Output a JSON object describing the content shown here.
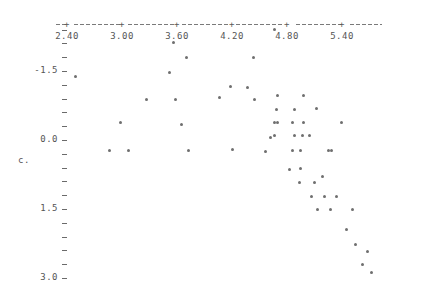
{
  "chart_data": {
    "type": "scatter",
    "title": "",
    "subtitle": "",
    "xlabel": "",
    "ylabel": "c.",
    "xlim": [
      2.28,
      5.84
    ],
    "ylim": [
      -2.52,
      3.18
    ],
    "grid": false,
    "legend": null,
    "marker": "*",
    "marker_color": "#6f6f6f",
    "x_ticks": [
      2.4,
      3.0,
      3.6,
      4.2,
      4.8,
      5.4
    ],
    "x_tick_labels": [
      "2.40",
      "3.00",
      "3.60",
      "4.20",
      "4.80",
      "5.40"
    ],
    "y_ticks": [
      3.0,
      2.7,
      2.4,
      2.1,
      1.8,
      1.5,
      1.2,
      0.9,
      0.6,
      0.3,
      0.0,
      -0.3,
      -0.6,
      -0.9,
      -1.2,
      -1.5,
      -1.8,
      -2.1,
      -2.4
    ],
    "y_major_ticks": [
      3.0,
      1.5,
      0.0,
      -1.5
    ],
    "y_major_tick_labels": [
      "3.0",
      "1.5",
      "0.0",
      "-1.5"
    ],
    "axis_style": "dashed-with-plus-ticks",
    "points": [
      {
        "x": 2.49,
        "y": -1.38
      },
      {
        "x": 2.86,
        "y": 0.23
      },
      {
        "x": 2.98,
        "y": -0.39
      },
      {
        "x": 3.07,
        "y": 0.23
      },
      {
        "x": 3.27,
        "y": -0.87
      },
      {
        "x": 3.52,
        "y": -1.47
      },
      {
        "x": 3.56,
        "y": -2.13
      },
      {
        "x": 3.58,
        "y": -0.87
      },
      {
        "x": 3.65,
        "y": -0.33
      },
      {
        "x": 3.7,
        "y": -1.8
      },
      {
        "x": 3.72,
        "y": 0.23
      },
      {
        "x": 4.06,
        "y": -0.93
      },
      {
        "x": 4.18,
        "y": -1.17
      },
      {
        "x": 4.21,
        "y": 0.2
      },
      {
        "x": 4.37,
        "y": -1.14
      },
      {
        "x": 4.43,
        "y": -1.8
      },
      {
        "x": 4.45,
        "y": -0.87
      },
      {
        "x": 4.56,
        "y": 0.25
      },
      {
        "x": 4.62,
        "y": -0.06
      },
      {
        "x": 4.66,
        "y": -0.09
      },
      {
        "x": 4.66,
        "y": -0.39
      },
      {
        "x": 4.7,
        "y": -0.39
      },
      {
        "x": 4.69,
        "y": -0.66
      },
      {
        "x": 4.7,
        "y": -0.96
      },
      {
        "x": 4.66,
        "y": -2.4
      },
      {
        "x": 4.83,
        "y": 0.65
      },
      {
        "x": 4.86,
        "y": 0.23
      },
      {
        "x": 4.88,
        "y": -0.09
      },
      {
        "x": 4.86,
        "y": -0.39
      },
      {
        "x": 4.88,
        "y": -0.66
      },
      {
        "x": 4.94,
        "y": 0.92
      },
      {
        "x": 4.95,
        "y": 0.62
      },
      {
        "x": 4.95,
        "y": 0.23
      },
      {
        "x": 4.97,
        "y": -0.09
      },
      {
        "x": 4.98,
        "y": -0.39
      },
      {
        "x": 4.98,
        "y": -0.96
      },
      {
        "x": 5.04,
        "y": -0.09
      },
      {
        "x": 5.07,
        "y": 1.22
      },
      {
        "x": 5.1,
        "y": 0.92
      },
      {
        "x": 5.12,
        "y": -0.68
      },
      {
        "x": 5.13,
        "y": 1.52
      },
      {
        "x": 5.19,
        "y": 0.8
      },
      {
        "x": 5.21,
        "y": 1.22
      },
      {
        "x": 5.25,
        "y": 0.23
      },
      {
        "x": 5.27,
        "y": 1.52
      },
      {
        "x": 5.29,
        "y": 0.23
      },
      {
        "x": 5.34,
        "y": 1.22
      },
      {
        "x": 5.39,
        "y": -0.39
      },
      {
        "x": 5.45,
        "y": 1.95
      },
      {
        "x": 5.51,
        "y": 1.52
      },
      {
        "x": 5.55,
        "y": 2.28
      },
      {
        "x": 5.62,
        "y": 2.7
      },
      {
        "x": 5.68,
        "y": 2.43
      },
      {
        "x": 5.72,
        "y": 2.88
      }
    ]
  }
}
